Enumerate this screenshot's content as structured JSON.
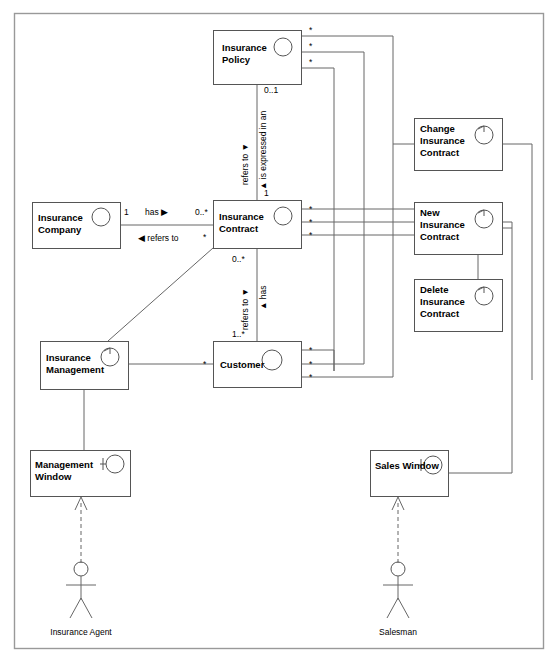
{
  "diagram": {
    "classes": [
      {
        "id": "insurance-policy",
        "name": "Insurance\nPolicy",
        "line1": "Insurance",
        "line2": "Policy",
        "line3": "",
        "x": 213,
        "y": 30,
        "w": 88,
        "h": 54,
        "icon": "entity-circle-icon"
      },
      {
        "id": "insurance-company",
        "name": "Insurance\nCompany",
        "line1": "Insurance",
        "line2": "Company",
        "line3": "",
        "x": 32,
        "y": 202,
        "w": 88,
        "h": 46,
        "icon": "entity-circle-icon"
      },
      {
        "id": "insurance-contract",
        "name": "Insurance\nContract",
        "line1": "Insurance",
        "line2": "Contract",
        "line3": "",
        "x": 213,
        "y": 200,
        "w": 88,
        "h": 48,
        "icon": "entity-circle-icon"
      },
      {
        "id": "change-insurance-contract",
        "name": "Change Insurance Contract",
        "line1": "Change",
        "line2": "Insurance",
        "line3": "Contract",
        "x": 414,
        "y": 118,
        "w": 88,
        "h": 52,
        "icon": "control-arrow-icon"
      },
      {
        "id": "new-insurance-contract",
        "name": "New Insurance Contract",
        "line1": "New",
        "line2": "Insurance",
        "line3": "Contract",
        "x": 414,
        "y": 202,
        "w": 88,
        "h": 52,
        "icon": "control-arrow-icon"
      },
      {
        "id": "delete-insurance-contract",
        "name": "Delete Insurance Contract",
        "line1": "Delete",
        "line2": "Insurance",
        "line3": "Contract",
        "x": 414,
        "y": 279,
        "w": 88,
        "h": 52,
        "icon": "control-arrow-icon"
      },
      {
        "id": "insurance-management",
        "name": "Insurance\nManagement",
        "line1": "Insurance",
        "line2": "Management",
        "line3": "",
        "x": 40,
        "y": 341,
        "w": 88,
        "h": 48,
        "icon": "control-arrow-icon"
      },
      {
        "id": "customer",
        "name": "Customer",
        "line1": "Customer",
        "line2": "",
        "line3": "",
        "x": 213,
        "y": 341,
        "w": 88,
        "h": 46,
        "icon": "entity-circle-icon"
      },
      {
        "id": "management-window",
        "name": "Management\nWindow",
        "line1": "Management",
        "line2": "Window",
        "line3": "",
        "x": 30,
        "y": 450,
        "w": 100,
        "h": 46,
        "icon": "boundary-icon"
      },
      {
        "id": "sales-window",
        "name": "Sales Window",
        "line1": "Sales Window",
        "line2": "",
        "line3": "",
        "x": 370,
        "y": 450,
        "w": 78,
        "h": 46,
        "icon": "boundary-icon"
      }
    ],
    "actors": [
      {
        "id": "insurance-agent",
        "label": "Insurance Agent",
        "x": 81,
        "y": 563
      },
      {
        "id": "salesman",
        "label": "Salesman",
        "x": 398,
        "y": 563
      }
    ],
    "multiplicities": {
      "policy_star_1": "*",
      "policy_star_2": "*",
      "policy_star_3": "*",
      "policy_to_contract_top": "0..1",
      "policy_to_contract_bottom": "1",
      "company_end": "1",
      "company_contract_end": "0..*",
      "company_refers_end": "*",
      "contract_star_1": "*",
      "contract_star_2": "*",
      "contract_star_3": "*",
      "contract_to_customer_top": "0..*",
      "contract_to_customer_bottom": "1..*",
      "customer_left_star": "*",
      "customer_star_1": "*",
      "customer_star_2": "*",
      "customer_star_3": "*"
    },
    "associations": {
      "has_right": "has ▶",
      "refers_to_left": "◀ refers to",
      "refers_to_vertical": "refers to ▼",
      "is_expressed_in_an": "▲ is expressed in an",
      "refers_to_vertical_2": "refers to ▼",
      "has_vertical": "▲ has"
    }
  }
}
